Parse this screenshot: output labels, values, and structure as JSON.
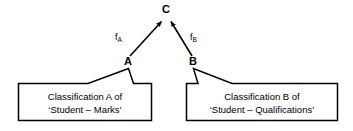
{
  "diagram": {
    "type": "classification-lattice-diagram",
    "background_color": "#ffffff",
    "stroke_color": "#000000",
    "nodes": [
      {
        "id": "C",
        "label": "C",
        "x": 166,
        "y": 10,
        "role": "common-classification"
      },
      {
        "id": "A",
        "label": "A",
        "x": 128,
        "y": 61,
        "role": "classification-a"
      },
      {
        "id": "B",
        "label": "B",
        "x": 193,
        "y": 61,
        "role": "classification-b"
      }
    ],
    "edges": [
      {
        "id": "fA",
        "from": "A",
        "to": "C",
        "label": "f",
        "subscript": "A",
        "arrow": true
      },
      {
        "id": "fB",
        "from": "B",
        "to": "C",
        "label": "f",
        "subscript": "B",
        "arrow": true
      }
    ],
    "boxes": [
      {
        "id": "box-a",
        "attached_to": "A",
        "line1": "Classification A of",
        "line2": "‘Student – Marks’",
        "x": 18,
        "y": 83,
        "width": 134,
        "height": 38
      },
      {
        "id": "box-b",
        "attached_to": "B",
        "line1": "Classification B of",
        "line2": "‘Student – Qualifications’",
        "x": 186,
        "y": 83,
        "width": 152,
        "height": 38
      }
    ]
  }
}
